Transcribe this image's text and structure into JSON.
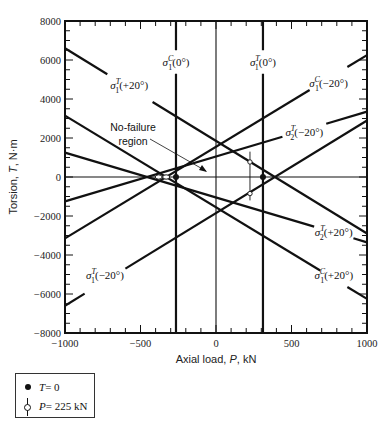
{
  "chart_data": {
    "type": "line",
    "title": "",
    "xlabel": "Axial load, P, kN",
    "ylabel": "Torsion, T, N·m",
    "xlim": [
      -1000,
      1000
    ],
    "ylim": [
      -8000,
      8000
    ],
    "x_ticks": [
      -1000,
      -500,
      0,
      500,
      1000
    ],
    "y_ticks": [
      -8000,
      -6000,
      -4000,
      -2000,
      0,
      2000,
      4000,
      6000,
      8000
    ],
    "x_tick_labels": [
      "−1000",
      "−500",
      "0",
      "500",
      "1000"
    ],
    "y_tick_labels": [
      "−8000",
      "−6000",
      "−4000",
      "−2000",
      "0",
      "2000",
      "4000",
      "6000",
      "8000"
    ],
    "grid": false,
    "reference_lines": {
      "P_zero": 0,
      "T_zero": 0
    },
    "series": [
      {
        "name": "σ1T(+20°)",
        "sym": "σ",
        "sub": "1",
        "sup": "T",
        "arg": "(+20°)",
        "x": [
          -1000,
          1000
        ],
        "y": [
          6600,
          -2900
        ]
      },
      {
        "name": "σ1T(−20°)",
        "sym": "σ",
        "sub": "1",
        "sup": "T",
        "arg": "(−20°)",
        "x": [
          -1000,
          1000
        ],
        "y": [
          -6600,
          2900
        ]
      },
      {
        "name": "σ1C(+20°)",
        "sym": "σ",
        "sub": "1",
        "sup": "C",
        "arg": "(+20°)",
        "x": [
          -1000,
          1000
        ],
        "y": [
          3150,
          -6250
        ]
      },
      {
        "name": "σ1C(−20°)",
        "sym": "σ",
        "sub": "1",
        "sup": "C",
        "arg": "(−20°)",
        "x": [
          -1000,
          1000
        ],
        "y": [
          -3150,
          6250
        ]
      },
      {
        "name": "σ2T(+20°)",
        "sym": "σ",
        "sub": "2",
        "sup": "T",
        "arg": "(+20°)",
        "x": [
          -1000,
          1000
        ],
        "y": [
          1250,
          -3350
        ]
      },
      {
        "name": "σ2T(−20°)",
        "sym": "σ",
        "sub": "2",
        "sup": "T",
        "arg": "(−20°)",
        "x": [
          -1000,
          1000
        ],
        "y": [
          -1250,
          3350
        ]
      },
      {
        "name": "σ1C(0°)",
        "sym": "σ",
        "sub": "1",
        "sup": "C",
        "arg": "(0°)",
        "x": [
          -265,
          -265
        ],
        "y": [
          -8000,
          8000
        ]
      },
      {
        "name": "σ1T(0°)",
        "sym": "σ",
        "sub": "1",
        "sup": "T",
        "arg": "(0°)",
        "x": [
          311,
          311
        ],
        "y": [
          -8000,
          8000
        ]
      }
    ],
    "markers": {
      "T0_points": [
        {
          "x": -265,
          "y": 0
        },
        {
          "x": 311,
          "y": 0
        }
      ],
      "P225_line": {
        "x": 225,
        "y": [
          1300,
          -1200
        ],
        "circles": [
          770,
          -850
        ]
      }
    },
    "annotations": [
      {
        "text_line1": "No-failure",
        "text_line2": "region",
        "arrow_to": {
          "x": 30,
          "y": 700
        }
      }
    ],
    "legend": [
      {
        "symbol": "filled-dot",
        "label_var": "T",
        "label_rest": " = 0"
      },
      {
        "symbol": "vertical-line-open-circle",
        "label_var": "P",
        "label_rest": " = 225 kN"
      }
    ],
    "legend_position": "bottom-left, below plot"
  },
  "labels": {
    "no_failure_1": "No-failure",
    "no_failure_2": "region"
  }
}
